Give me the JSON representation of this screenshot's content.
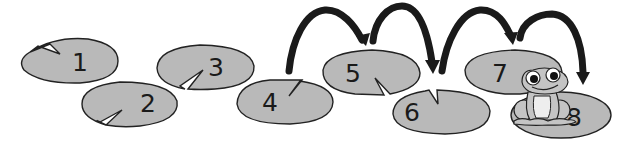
{
  "diagram": {
    "type": "number-line-jumps",
    "colors": {
      "background": "#ffffff",
      "pad_fill": "#b9b9b9",
      "pad_stroke": "#222222",
      "arrow": "#1a1a1a",
      "frog_fill": "#c4c4c4",
      "frog_belly": "#eeeeee"
    },
    "pads": [
      {
        "label": "1",
        "cx": 70,
        "cy": 61,
        "rx": 48,
        "ry": 22
      },
      {
        "label": "2",
        "cx": 130,
        "cy": 104,
        "rx": 49,
        "ry": 22
      },
      {
        "label": "3",
        "cx": 205,
        "cy": 67,
        "rx": 49,
        "ry": 22
      },
      {
        "label": "4",
        "cx": 285,
        "cy": 102,
        "rx": 49,
        "ry": 22
      },
      {
        "label": "5",
        "cx": 371,
        "cy": 72,
        "rx": 49,
        "ry": 22
      },
      {
        "label": "6",
        "cx": 441,
        "cy": 111,
        "rx": 49,
        "ry": 22
      },
      {
        "label": "7",
        "cx": 513,
        "cy": 72,
        "rx": 49,
        "ry": 22
      },
      {
        "label": "8",
        "cx": 561,
        "cy": 115,
        "rx": 50,
        "ry": 23
      }
    ],
    "jumps": [
      {
        "from": "4",
        "to": "5"
      },
      {
        "from": "5",
        "to": "6"
      },
      {
        "from": "6",
        "to": "7"
      },
      {
        "from": "7",
        "to": "8"
      }
    ],
    "frog": {
      "on_pad": "8"
    }
  }
}
